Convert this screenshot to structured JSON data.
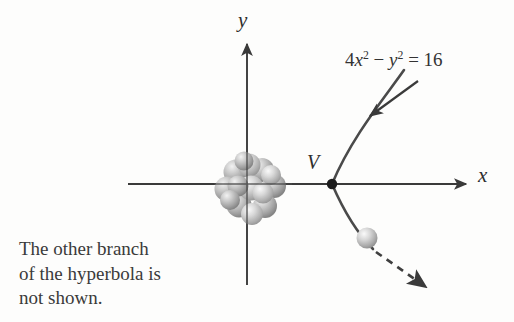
{
  "figure": {
    "kind": "math-diagram-hyperbola",
    "background_color": "#fdfdfc",
    "ink_color": "#3a3a3a",
    "axes": {
      "x_label": "x",
      "y_label": "y",
      "origin_px": [
        247,
        184
      ],
      "x_axis_from_px": [
        128,
        184
      ],
      "x_axis_to_px": [
        470,
        184
      ],
      "y_axis_from_px": [
        247,
        285
      ],
      "y_axis_to_px": [
        247,
        40
      ],
      "arrowheads": [
        "x-positive",
        "y-positive"
      ]
    },
    "vertex": {
      "label": "V",
      "position_px": [
        332,
        184
      ],
      "marker": "filled-dot"
    },
    "equation": {
      "coefficient_x": "4",
      "var_x": "x",
      "exp_x": "2",
      "minus": "−",
      "var_y": "y",
      "exp_y": "2",
      "equals": "=",
      "constant": "16",
      "plain_text": "4x² − y² = 16",
      "position_px": [
        345,
        50
      ]
    },
    "callout_arrow": {
      "from_px": [
        418,
        82
      ],
      "to_px": [
        368,
        118
      ],
      "style": "solid",
      "points_to": "hyperbola-branch"
    },
    "curve": {
      "name": "hyperbola-right-branch",
      "style": "solid",
      "color": "#4a4a4a",
      "opens": "right",
      "upper_end_px": [
        404,
        70
      ],
      "lower_end_px": [
        372,
        248
      ]
    },
    "dashed_continuation": {
      "name": "trajectory-continuation",
      "style": "dashed",
      "from_px": [
        374,
        252
      ],
      "to_px": [
        432,
        292
      ],
      "arrowhead": true
    },
    "nucleus_cluster": {
      "name": "sphere-cluster-at-origin",
      "center_px": [
        252,
        188
      ],
      "radius_px": 31,
      "sphere_count": 14,
      "color": "#b4b4b4",
      "description": "cluster of shaded gray spheres drawn at the origin"
    },
    "particle": {
      "name": "single-sphere-on-curve",
      "center_px": [
        367,
        238
      ],
      "radius_px": 10,
      "color": "#c9c9c9"
    },
    "caption": {
      "text": "The other branch\nof the hyperbola is\nnot shown.",
      "position_px": [
        19,
        237
      ]
    }
  }
}
